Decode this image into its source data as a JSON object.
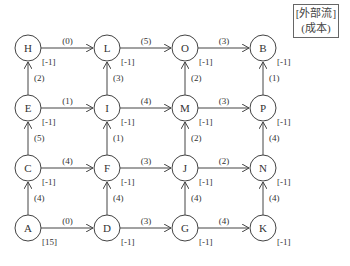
{
  "legend": {
    "line1": "[外部流]",
    "line2": "(成本)"
  },
  "node_radius": 13,
  "nodes": [
    {
      "id": "H",
      "x": 28,
      "y": 48,
      "flow": "[-1]"
    },
    {
      "id": "L",
      "x": 107,
      "y": 48,
      "flow": "[-1]"
    },
    {
      "id": "O",
      "x": 185,
      "y": 48,
      "flow": "[-1]"
    },
    {
      "id": "B",
      "x": 263,
      "y": 48,
      "flow": "[-1]"
    },
    {
      "id": "E",
      "x": 28,
      "y": 108,
      "flow": "[-1]"
    },
    {
      "id": "I",
      "x": 107,
      "y": 108,
      "flow": "[-1]"
    },
    {
      "id": "M",
      "x": 185,
      "y": 108,
      "flow": "[-1]"
    },
    {
      "id": "P",
      "x": 263,
      "y": 108,
      "flow": "[-1]"
    },
    {
      "id": "C",
      "x": 28,
      "y": 168,
      "flow": "[-1]"
    },
    {
      "id": "F",
      "x": 107,
      "y": 168,
      "flow": "[-1]"
    },
    {
      "id": "J",
      "x": 185,
      "y": 168,
      "flow": "[-1]"
    },
    {
      "id": "N",
      "x": 263,
      "y": 168,
      "flow": "[-1]"
    },
    {
      "id": "A",
      "x": 28,
      "y": 228,
      "flow": "[15]"
    },
    {
      "id": "D",
      "x": 107,
      "y": 228,
      "flow": "[-1]"
    },
    {
      "id": "G",
      "x": 185,
      "y": 228,
      "flow": "[-1]"
    },
    {
      "id": "K",
      "x": 263,
      "y": 228,
      "flow": "[-1]"
    }
  ],
  "edges": [
    {
      "from": "H",
      "to": "L",
      "cost": "(0)"
    },
    {
      "from": "L",
      "to": "O",
      "cost": "(5)"
    },
    {
      "from": "O",
      "to": "B",
      "cost": "(3)"
    },
    {
      "from": "E",
      "to": "I",
      "cost": "(1)"
    },
    {
      "from": "I",
      "to": "M",
      "cost": "(4)"
    },
    {
      "from": "M",
      "to": "P",
      "cost": "(3)"
    },
    {
      "from": "C",
      "to": "F",
      "cost": "(4)"
    },
    {
      "from": "F",
      "to": "J",
      "cost": "(3)"
    },
    {
      "from": "J",
      "to": "N",
      "cost": "(2)"
    },
    {
      "from": "A",
      "to": "D",
      "cost": "(0)"
    },
    {
      "from": "D",
      "to": "G",
      "cost": "(3)"
    },
    {
      "from": "G",
      "to": "K",
      "cost": "(4)"
    },
    {
      "from": "E",
      "to": "H",
      "cost": "(2)"
    },
    {
      "from": "C",
      "to": "E",
      "cost": "(5)"
    },
    {
      "from": "A",
      "to": "C",
      "cost": "(4)"
    },
    {
      "from": "I",
      "to": "L",
      "cost": "(3)"
    },
    {
      "from": "F",
      "to": "I",
      "cost": "(1)"
    },
    {
      "from": "D",
      "to": "F",
      "cost": "(4)"
    },
    {
      "from": "M",
      "to": "O",
      "cost": "(2)"
    },
    {
      "from": "J",
      "to": "M",
      "cost": "(2)"
    },
    {
      "from": "G",
      "to": "J",
      "cost": "(4)"
    },
    {
      "from": "P",
      "to": "B",
      "cost": "(1)"
    },
    {
      "from": "N",
      "to": "P",
      "cost": "(4)"
    },
    {
      "from": "K",
      "to": "N",
      "cost": "(4)"
    }
  ],
  "colors": {
    "stroke": "#444444",
    "text": "#333333"
  }
}
